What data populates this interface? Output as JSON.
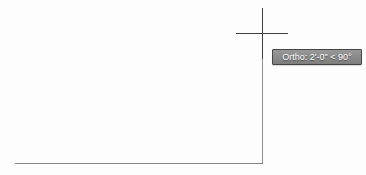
{
  "canvas": {
    "background": "#fdfdfd"
  },
  "entities": {
    "line_color": "#848484",
    "horizontal_line": {
      "x1": 15,
      "y1": 163,
      "x2": 262,
      "y2": 163
    },
    "rubber_band_line": {
      "x1": 262,
      "y1": 163,
      "x2": 262,
      "y2": 33
    }
  },
  "cursor": {
    "type": "crosshair",
    "color": "#3f3f3f",
    "center_x": 262,
    "center_y": 33
  },
  "tooltip": {
    "label": "Ortho: 2'-0\" < 90°",
    "background": "#8c8c8c",
    "border_color": "#454545",
    "text_color": "#ffffff"
  }
}
